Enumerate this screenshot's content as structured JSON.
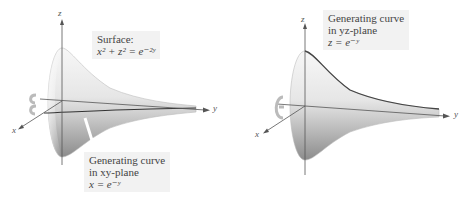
{
  "figures": [
    {
      "id": "left",
      "surface_label": {
        "title": "Surface:",
        "equation": "x² + z² = e⁻²ʸ"
      },
      "curve_label": {
        "line1": "Generating curve",
        "line2": "in xy-plane",
        "equation": "x = e⁻ʸ"
      },
      "axes": {
        "x": "x",
        "y": "y",
        "z": "z"
      }
    },
    {
      "id": "right",
      "curve_label": {
        "line1": "Generating curve",
        "line2": "in yz-plane",
        "equation": "z = e⁻ʸ"
      },
      "axes": {
        "x": "x",
        "y": "y",
        "z": "z"
      }
    }
  ],
  "colors": {
    "surface_light": "#f4f4f4",
    "surface_dark": "#8a8a8a",
    "axis": "#555555",
    "label_bg": "#f2f2f2"
  }
}
